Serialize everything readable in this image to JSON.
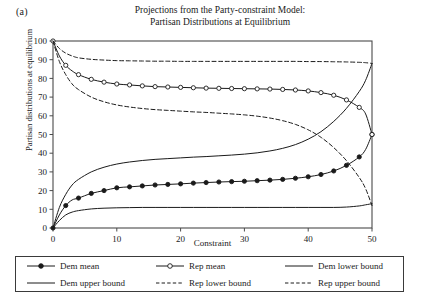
{
  "panel_label": "(a)",
  "title_line1": "Projections from the Party-constraint Model:",
  "title_line2": "Partisan Distributions at Equilibrium",
  "axes": {
    "xlabel": "Constraint",
    "ylabel": "Partisan distributions at equilibrium",
    "xticks": [
      "0",
      "10",
      "20",
      "30",
      "40",
      "50"
    ],
    "yticks": [
      "0",
      "10",
      "20",
      "30",
      "40",
      "50",
      "60",
      "70",
      "80",
      "90",
      "100"
    ]
  },
  "legend": {
    "items": [
      {
        "label": "Dem mean",
        "style": "solid-marker-filled"
      },
      {
        "label": "Rep mean",
        "style": "solid-marker-open"
      },
      {
        "label": "Dem lower bound",
        "style": "solid"
      },
      {
        "label": "Dem upper bound",
        "style": "solid"
      },
      {
        "label": "Rep lower bound",
        "style": "dashed"
      },
      {
        "label": "Rep upper bound",
        "style": "dashed"
      }
    ]
  },
  "colors": {
    "line": "#1a1a1a",
    "frame": "#4a4a4a",
    "background": "#ffffff"
  },
  "chart_data": {
    "type": "line",
    "title": "Projections from the Party-constraint Model: Partisan Distributions at Equilibrium",
    "xlabel": "Constraint",
    "ylabel": "Partisan distributions at equilibrium",
    "xlim": [
      0,
      50
    ],
    "ylim": [
      0,
      100
    ],
    "xticks": [
      0,
      10,
      20,
      30,
      40,
      50
    ],
    "yticks": [
      0,
      10,
      20,
      30,
      40,
      50,
      60,
      70,
      80,
      90,
      100
    ],
    "grid": false,
    "legend_position": "below-axes",
    "x": [
      0,
      1,
      2,
      3,
      4,
      6,
      8,
      10,
      12,
      14,
      16,
      18,
      20,
      22,
      24,
      26,
      28,
      30,
      32,
      34,
      36,
      38,
      40,
      42,
      44,
      46,
      48,
      49,
      50
    ],
    "series": [
      {
        "name": "Dem mean",
        "style": "solid",
        "marker": "filled-circle",
        "values": [
          0,
          7,
          12,
          15,
          16,
          18.5,
          20,
          21.5,
          22,
          22.5,
          23,
          23.3,
          23.6,
          24,
          24.3,
          24.6,
          24.8,
          25,
          25.3,
          25.6,
          26,
          26.6,
          27.4,
          28.6,
          30.5,
          33.5,
          38,
          42,
          50
        ]
      },
      {
        "name": "Rep mean",
        "style": "solid",
        "marker": "open-circle",
        "values": [
          100,
          92,
          87,
          84,
          82,
          79.5,
          78,
          77,
          76.5,
          76,
          75.6,
          75.4,
          75.2,
          75,
          74.8,
          74.7,
          74.6,
          74.5,
          74.4,
          74.3,
          74.1,
          73.8,
          73.3,
          72.4,
          71,
          68.5,
          64.5,
          61,
          50
        ]
      },
      {
        "name": "Dem lower bound",
        "style": "solid",
        "marker": "none",
        "values": [
          0,
          4,
          7,
          8.5,
          9.3,
          10.2,
          10.6,
          10.8,
          10.9,
          11,
          11,
          11,
          11,
          11,
          11,
          11,
          11,
          11,
          11,
          11,
          11,
          11,
          11,
          11,
          11,
          11.2,
          11.8,
          12.4,
          13
        ]
      },
      {
        "name": "Dem upper bound",
        "style": "solid",
        "marker": "none",
        "values": [
          0,
          11,
          18,
          23,
          26,
          30,
          32.5,
          34.2,
          35.3,
          36.1,
          36.7,
          37.1,
          37.5,
          37.9,
          38.2,
          38.6,
          39,
          39.5,
          40.2,
          41.2,
          42.6,
          44.6,
          47.5,
          51.5,
          57,
          64,
          73,
          79,
          88
        ]
      },
      {
        "name": "Rep lower bound",
        "style": "dashed",
        "marker": "none",
        "values": [
          100,
          89,
          82,
          77,
          74,
          70,
          67.5,
          65.8,
          64.7,
          63.9,
          63.3,
          62.9,
          62.5,
          62.1,
          61.8,
          61.4,
          61,
          60.5,
          59.8,
          58.8,
          57.4,
          55.4,
          52.5,
          48.5,
          43,
          36,
          27,
          21,
          12
        ]
      },
      {
        "name": "Rep upper bound",
        "style": "dashed",
        "marker": "none",
        "values": [
          100,
          96,
          93.5,
          92,
          91,
          90.2,
          89.8,
          89.5,
          89.4,
          89.3,
          89.2,
          89.2,
          89.1,
          89.1,
          89.1,
          89.1,
          89.1,
          89.1,
          89.1,
          89.1,
          89.1,
          89.1,
          89,
          89,
          88.9,
          88.8,
          88.6,
          88.4,
          88
        ]
      }
    ]
  }
}
